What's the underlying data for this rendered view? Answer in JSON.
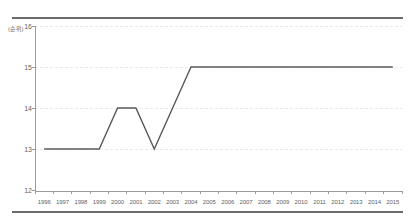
{
  "chart_data": {
    "type": "line",
    "title": "",
    "subtitle": "",
    "xlabel": "",
    "ylabel": "",
    "y_unit_label": "(순위)",
    "x": [
      "1996",
      "1997",
      "1998",
      "1999",
      "2000",
      "2001",
      "2002",
      "2003",
      "2004",
      "2005",
      "2006",
      "2007",
      "2008",
      "2009",
      "2010",
      "2011",
      "2012",
      "2013",
      "2014",
      "2015"
    ],
    "categories": [
      "1996",
      "1997",
      "1998",
      "1999",
      "2000",
      "2001",
      "2002",
      "2003",
      "2004",
      "2005",
      "2006",
      "2007",
      "2008",
      "2009",
      "2010",
      "2011",
      "2012",
      "2013",
      "2014",
      "2015"
    ],
    "values": [
      13,
      13,
      13,
      13,
      14,
      14,
      13,
      14,
      15,
      15,
      15,
      15,
      15,
      15,
      15,
      15,
      15,
      15,
      15,
      15
    ],
    "series": [
      {
        "name": "rank",
        "values": [
          13,
          13,
          13,
          13,
          14,
          14,
          13,
          14,
          15,
          15,
          15,
          15,
          15,
          15,
          15,
          15,
          15,
          15,
          15,
          15
        ],
        "color": "#595959"
      }
    ],
    "ylim": [
      12,
      16
    ],
    "yticks": [
      12,
      13,
      14,
      15,
      16
    ],
    "ytick_labels": [
      "12",
      "13",
      "14",
      "15",
      "16"
    ],
    "grid": true,
    "grid_axis": "y",
    "legend": false,
    "legend_position": "none"
  },
  "style": {
    "line_color": "#595959",
    "axis_color": "#9a9a9a",
    "grid_color": "#e9e9ec",
    "frame_color": "#6b6b6b",
    "tick_text_color": "#5f5f5f",
    "background": "#ffffff"
  }
}
